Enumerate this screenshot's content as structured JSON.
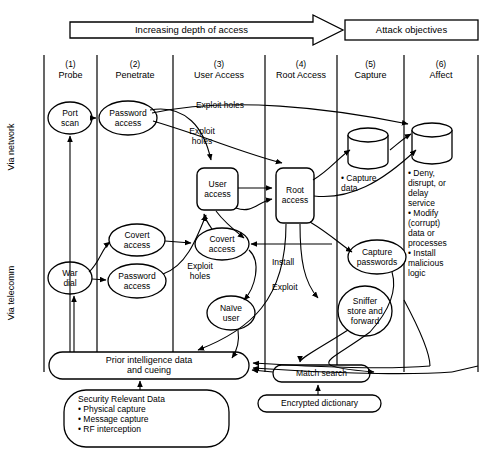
{
  "diagram": {
    "title_banner": "Increasing depth of access",
    "objectives_box": "Attack objectives",
    "side_labels": [
      {
        "id": "via-network",
        "text": "Via network"
      },
      {
        "id": "via-telecomm",
        "text": "Via telecomm"
      }
    ],
    "columns": [
      {
        "num": "(1)",
        "name": "Probe"
      },
      {
        "num": "(2)",
        "name": "Penetrate"
      },
      {
        "num": "(3)",
        "name": "User Access"
      },
      {
        "num": "(4)",
        "name": "Root Access"
      },
      {
        "num": "(5)",
        "name": "Capture"
      },
      {
        "num": "(6)",
        "name": "Affect"
      }
    ],
    "nodes": [
      {
        "id": "port-scan",
        "label": "Port\nscan",
        "shape": "ellipse"
      },
      {
        "id": "password-access-net",
        "label": "Password\naccess",
        "shape": "ellipse"
      },
      {
        "id": "war-dial",
        "label": "War\ndial",
        "shape": "ellipse"
      },
      {
        "id": "covert-access-penetrate",
        "label": "Covert\naccess",
        "shape": "ellipse"
      },
      {
        "id": "password-access-tel",
        "label": "Password\naccess",
        "shape": "ellipse"
      },
      {
        "id": "user-access",
        "label": "User\naccess",
        "shape": "rounded-rect"
      },
      {
        "id": "covert-access-user",
        "label": "Covert\naccess",
        "shape": "ellipse"
      },
      {
        "id": "naive-user",
        "label": "Naïve\nuser",
        "shape": "ellipse"
      },
      {
        "id": "root-access",
        "label": "Root\naccess",
        "shape": "rounded-rect"
      },
      {
        "id": "capture-data",
        "label": "• Capture\n  data",
        "shape": "cylinder"
      },
      {
        "id": "capture-passwords",
        "label": "Capture\npasswords",
        "shape": "ellipse"
      },
      {
        "id": "sniffer-store-forward",
        "label": "Sniffer\nstore and\nforward",
        "shape": "ellipse"
      },
      {
        "id": "affect-outcomes",
        "label": "• Deny,\n  disrupt, or\n  delay\n  service\n• Modify\n  (corrupt)\n  data or\n  processes\n• Install\n  malicious\n  logic",
        "shape": "cylinder"
      },
      {
        "id": "prior-intelligence",
        "label": "Prior intelligence data\nand cueing",
        "shape": "stadium"
      },
      {
        "id": "security-relevant-data",
        "label": "Security Relevant Data\n• Physical capture\n• Message capture\n• RF interception",
        "shape": "stadium"
      },
      {
        "id": "match-search",
        "label": "Match search",
        "shape": "stadium"
      },
      {
        "id": "encrypted-dictionary",
        "label": "Encrypted dictionary",
        "shape": "stadium"
      }
    ],
    "edge_labels": [
      {
        "id": "exploit-holes-top",
        "text": "Exploit holes"
      },
      {
        "id": "exploit-holes-mid",
        "text": "Exploit\nholes"
      },
      {
        "id": "exploit-holes-lower",
        "text": "Exploit\nholes"
      },
      {
        "id": "install",
        "text": "Install"
      },
      {
        "id": "exploit",
        "text": "Exploit"
      }
    ],
    "colors": {
      "stroke": "#000000",
      "fill": "#ffffff",
      "background": "#ffffff"
    }
  }
}
